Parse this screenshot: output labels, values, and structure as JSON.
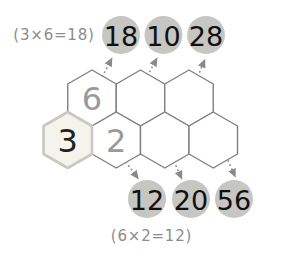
{
  "figure": {
    "top_equation_label": "(3×6=18)",
    "bottom_equation_label": "(6×2=12)",
    "top_circles": [
      "18",
      "10",
      "28"
    ],
    "bottom_circles": [
      "12",
      "20",
      "56"
    ],
    "hex_top_row": [
      "6",
      "",
      ""
    ],
    "hex_bottom_row": [
      "3",
      "2",
      "",
      ""
    ],
    "colors": {
      "background": "#ffffff",
      "hex_stroke": "#808080",
      "hex_fill": "#ffffff",
      "highlight_fill": "#f5f4ec",
      "highlight_stroke": "#c9c8c1",
      "hex_value_gray": "#9a9a9a",
      "hex_value_dark": "#222222",
      "circle_fill": "#c6c6c3",
      "circle_text": "#111111",
      "label_text": "#8c8c8c",
      "arrow": "#8a8a8a"
    }
  }
}
